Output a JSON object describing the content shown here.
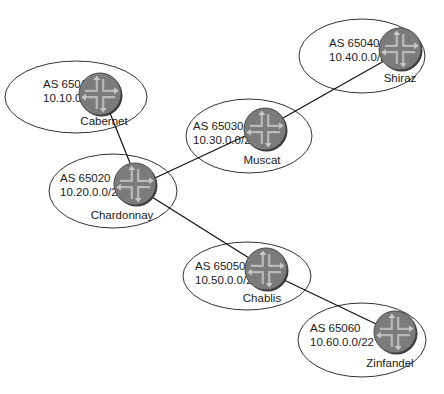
{
  "diagram": {
    "type": "network-topology",
    "nodes": [
      {
        "id": "cabernet",
        "name": "Cabernet",
        "as": "AS 65010",
        "prefix": "10.10.0.0/22",
        "ellipse": {
          "cx": 76,
          "cy": 97,
          "rx": 71,
          "ry": 36
        },
        "router": {
          "cx": 100,
          "cy": 94,
          "r": 21
        },
        "text": {
          "x": 43,
          "as_y": 88,
          "prefix_y": 102
        },
        "name_pos": {
          "x": 104,
          "y": 125
        }
      },
      {
        "id": "shiraz",
        "name": "Shiraz",
        "as": "AS 65040",
        "prefix": "10.40.0.0/22",
        "ellipse": {
          "cx": 362,
          "cy": 56,
          "rx": 63,
          "ry": 37
        },
        "router": {
          "cx": 400,
          "cy": 49,
          "r": 21
        },
        "text": {
          "x": 329,
          "as_y": 47,
          "prefix_y": 61
        },
        "name_pos": {
          "x": 400,
          "y": 82
        }
      },
      {
        "id": "muscat",
        "name": "Muscat",
        "as": "AS 65030",
        "prefix": "10.30.0.0/22",
        "ellipse": {
          "cx": 249,
          "cy": 136,
          "rx": 63,
          "ry": 37
        },
        "router": {
          "cx": 265,
          "cy": 129,
          "r": 21
        },
        "text": {
          "x": 193,
          "as_y": 130,
          "prefix_y": 144
        },
        "name_pos": {
          "x": 262,
          "y": 164
        }
      },
      {
        "id": "chardonnay",
        "name": "Chardonnay",
        "as": "AS 65020",
        "prefix": "10.20.0.0/22",
        "ellipse": {
          "cx": 113,
          "cy": 191,
          "rx": 64,
          "ry": 37
        },
        "router": {
          "cx": 135,
          "cy": 184,
          "r": 21
        },
        "text": {
          "x": 60,
          "as_y": 182,
          "prefix_y": 196
        },
        "name_pos": {
          "x": 122,
          "y": 219
        }
      },
      {
        "id": "chablis",
        "name": "Chablis",
        "as": "AS 65050",
        "prefix": "10.50.0.0/22",
        "ellipse": {
          "cx": 247,
          "cy": 276,
          "rx": 64,
          "ry": 34
        },
        "router": {
          "cx": 266,
          "cy": 269,
          "r": 21
        },
        "text": {
          "x": 195,
          "as_y": 270,
          "prefix_y": 284
        },
        "name_pos": {
          "x": 262,
          "y": 302
        }
      },
      {
        "id": "zinfandel",
        "name": "Zinfandel",
        "as": "AS 65060",
        "prefix": "10.60.0.0/22",
        "ellipse": {
          "cx": 362,
          "cy": 340,
          "rx": 64,
          "ry": 37
        },
        "router": {
          "cx": 395,
          "cy": 332,
          "r": 21
        },
        "text": {
          "x": 310,
          "as_y": 332,
          "prefix_y": 346
        },
        "name_pos": {
          "x": 390,
          "y": 367
        }
      }
    ],
    "links": [
      {
        "from": "cabernet",
        "to": "chardonnay",
        "x1": 110,
        "y1": 113,
        "x2": 130,
        "y2": 163
      },
      {
        "from": "chardonnay",
        "to": "muscat",
        "x1": 155,
        "y1": 178,
        "x2": 245,
        "y2": 136
      },
      {
        "from": "muscat",
        "to": "shiraz",
        "x1": 283,
        "y1": 118,
        "x2": 384,
        "y2": 61
      },
      {
        "from": "chardonnay",
        "to": "chablis",
        "x1": 152,
        "y1": 197,
        "x2": 249,
        "y2": 258
      },
      {
        "from": "chablis",
        "to": "zinfandel",
        "x1": 284,
        "y1": 280,
        "x2": 376,
        "y2": 324
      }
    ],
    "colors": {
      "router_fill": "#7b7b7b",
      "router_glyph": "#b9b9b9",
      "line": "#111111",
      "ellipse_stroke": "#333333"
    }
  }
}
